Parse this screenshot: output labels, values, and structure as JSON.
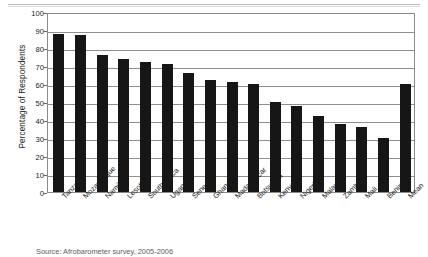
{
  "chart_data": {
    "type": "bar",
    "title": "",
    "subtitle": "",
    "xlabel": "",
    "ylabel": "Percentage of Respondents",
    "ylim": [
      0,
      100
    ],
    "ytick_step": 10,
    "yticks": [
      0,
      10,
      20,
      30,
      40,
      50,
      60,
      70,
      80,
      90,
      100
    ],
    "grid": true,
    "legend": false,
    "legend_position": "none",
    "bar_color": "#161616",
    "categories": [
      "Tanzania",
      "Mozambique",
      "Namibia",
      "Lesotho",
      "South Africa",
      "Uganda",
      "Senegal",
      "Ghana",
      "Madagascar",
      "Botswana",
      "Kenya",
      "Nigeria",
      "Malawi",
      "Zambia",
      "Mali",
      "Benin",
      "Mean"
    ],
    "values": [
      88,
      87,
      76,
      74,
      72,
      71,
      66,
      62,
      61,
      60,
      50,
      48,
      42,
      38,
      36,
      30,
      60
    ]
  },
  "source": {
    "text": "Source: Afrobarometer survey, 2005-2006"
  }
}
